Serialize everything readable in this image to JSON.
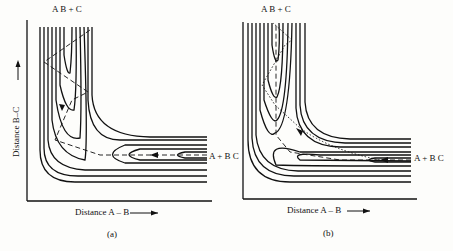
{
  "figure": {
    "panels": [
      {
        "id": "a",
        "caption": "(a)",
        "top_label": "A B + C",
        "right_label": "A + B C",
        "x_axis_label": "Distance A – B",
        "y_axis_label": "Distance B–C",
        "path_style": "dashed trajectory bouncing across entrance valley into exit valley"
      },
      {
        "id": "b",
        "caption": "(b)",
        "top_label": "A B + C",
        "right_label": "A + B C",
        "x_axis_label": "Distance A – B",
        "y_axis_label": "Distance B–C",
        "path_style": "dashed and dotted trajectories through well near corner"
      }
    ],
    "colors": {
      "ink": "#111111",
      "paper": "#fdfdfb"
    }
  }
}
